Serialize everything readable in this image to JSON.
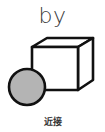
{
  "card": {
    "word": "by",
    "caption": "近接"
  },
  "illustration": {
    "cube": {
      "front_face": {
        "x": 32,
        "y": 47,
        "width": 46,
        "height": 43
      },
      "depth_offset": {
        "dx": 15,
        "dy": -9
      },
      "stroke_color": "#111111",
      "fill_color": "#ffffff"
    },
    "sphere": {
      "cx": 27,
      "cy": 87,
      "r": 18,
      "fill_color": "#b4b4b4",
      "stroke_color": "#111111"
    },
    "relation": "sphere is next to the cube"
  }
}
